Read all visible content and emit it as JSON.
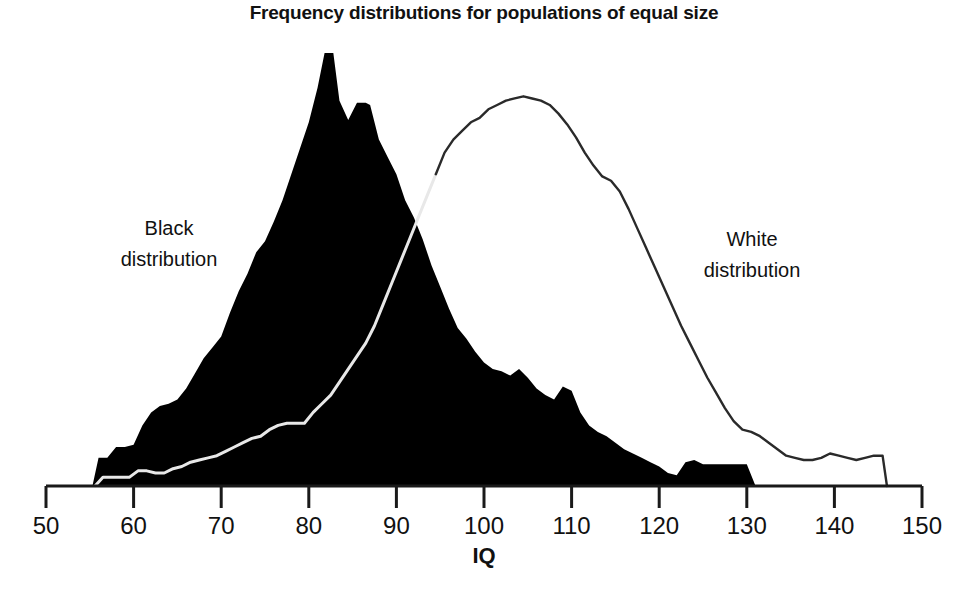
{
  "chart_data": {
    "type": "area",
    "title": "Frequency distributions for populations of equal size",
    "xlabel": "IQ",
    "ylabel": "",
    "xlim": [
      50,
      150
    ],
    "ylim": [
      0,
      100
    ],
    "xticks": [
      50,
      60,
      70,
      80,
      90,
      100,
      110,
      120,
      130,
      140,
      150
    ],
    "xtick_labels": [
      "50",
      "60",
      "70",
      "80",
      "90",
      "100",
      "110",
      "120",
      "130",
      "140",
      "150"
    ],
    "grid": false,
    "legend_position": "inline-annotations",
    "annotations": [
      {
        "text_line1": "Black",
        "text_line2": "distribution",
        "x": 62,
        "y": 62
      },
      {
        "text_line1": "White",
        "text_line2": "distribution",
        "x": 133,
        "y": 57
      }
    ],
    "series": [
      {
        "name": "Black distribution",
        "style": "filled-black-area",
        "color": "#000000",
        "x": [
          55.3,
          56.0,
          57.0,
          58.0,
          59.0,
          60.0,
          61.0,
          62.0,
          63.0,
          64.0,
          65.0,
          66.0,
          67.0,
          68.0,
          69.0,
          70.0,
          71.0,
          72.0,
          73.0,
          74.0,
          75.0,
          76.0,
          77.0,
          78.0,
          79.0,
          80.0,
          81.0,
          81.8,
          82.8,
          83.5,
          84.5,
          85.5,
          86.5,
          87.0,
          88.0,
          89.0,
          90.0,
          91.0,
          92.0,
          93.0,
          94.0,
          95.0,
          96.0,
          97.0,
          98.0,
          99.0,
          100.0,
          101.0,
          102.0,
          103.0,
          104.0,
          105.0,
          106.0,
          107.0,
          108.0,
          109.0,
          110.0,
          111.0,
          112.0,
          113.0,
          114.0,
          115.0,
          116.0,
          117.0,
          118.0,
          119.0,
          120.0,
          121.0,
          122.0,
          123.0,
          124.0,
          125.0,
          126.0,
          127.0,
          128.0,
          129.0,
          130.0,
          131.0
        ],
        "y": [
          0,
          6.5,
          6.5,
          9.0,
          9.0,
          9.5,
          14.0,
          17.0,
          18.5,
          19.0,
          20.0,
          22.5,
          26.0,
          29.5,
          32.0,
          34.5,
          40.0,
          45.0,
          49.0,
          54.0,
          56.5,
          61.0,
          66.0,
          72.0,
          78.0,
          84.0,
          92.0,
          100.0,
          100.0,
          89.0,
          84.5,
          88.5,
          88.5,
          88.0,
          80.0,
          76.0,
          72.0,
          66.0,
          62.0,
          57.0,
          51.0,
          46.0,
          41.0,
          36.5,
          34.0,
          31.0,
          28.5,
          27.0,
          26.5,
          25.5,
          27.0,
          25.0,
          22.5,
          21.0,
          20.0,
          23.0,
          22.0,
          17.0,
          14.0,
          12.5,
          11.5,
          10.0,
          8.5,
          7.5,
          6.5,
          5.5,
          4.5,
          3.0,
          2.5,
          5.5,
          6.0,
          5.0,
          5.0,
          5.0,
          5.0,
          5.0,
          5.0,
          0
        ]
      },
      {
        "name": "White distribution",
        "style": "outline-curve",
        "color": "#2a2a2a",
        "x": [
          55.6,
          56.5,
          57.5,
          58.5,
          59.5,
          60.5,
          61.5,
          62.5,
          63.5,
          64.5,
          65.5,
          66.5,
          67.5,
          68.5,
          69.5,
          70.5,
          71.5,
          72.5,
          73.5,
          74.5,
          75.5,
          76.5,
          77.5,
          78.5,
          79.5,
          80.5,
          81.5,
          82.5,
          83.5,
          84.5,
          85.5,
          86.5,
          87.5,
          88.5,
          89.5,
          90.5,
          91.5,
          92.5,
          93.5,
          94.5,
          95.5,
          96.5,
          97.5,
          98.5,
          99.5,
          100.5,
          101.5,
          102.5,
          103.5,
          104.5,
          105.5,
          106.5,
          107.5,
          108.5,
          109.5,
          110.5,
          111.5,
          112.5,
          113.5,
          114.5,
          115.5,
          116.5,
          117.5,
          118.5,
          119.5,
          120.5,
          121.5,
          122.5,
          123.5,
          124.5,
          125.5,
          126.5,
          127.5,
          128.5,
          129.5,
          130.5,
          131.5,
          132.5,
          133.5,
          134.5,
          135.5,
          136.5,
          137.5,
          138.5,
          139.5,
          140.5,
          141.5,
          142.5,
          143.5,
          144.5,
          145.5,
          146.0
        ],
        "y": [
          0,
          2.0,
          2.0,
          2.0,
          2.0,
          3.5,
          3.5,
          3.0,
          3.0,
          4.0,
          4.5,
          5.5,
          6.0,
          6.5,
          7.0,
          8.0,
          9.0,
          10.0,
          11.0,
          11.5,
          13.0,
          14.0,
          14.5,
          14.5,
          14.5,
          17.0,
          19.0,
          21.0,
          24.0,
          27.0,
          30.0,
          33.0,
          37.0,
          42.0,
          47.0,
          52.0,
          57.0,
          62.0,
          67.0,
          72.0,
          77.0,
          80.0,
          82.0,
          84.0,
          85.0,
          87.0,
          88.0,
          89.0,
          89.5,
          90.0,
          89.5,
          89.0,
          88.0,
          86.0,
          83.5,
          80.5,
          77.0,
          74.0,
          71.5,
          70.5,
          68.0,
          64.0,
          59.5,
          55.0,
          50.5,
          46.0,
          41.5,
          37.0,
          33.0,
          29.0,
          25.0,
          21.5,
          18.0,
          15.0,
          13.0,
          12.5,
          11.5,
          10.0,
          8.5,
          7.0,
          6.5,
          6.0,
          6.0,
          6.5,
          7.5,
          7.0,
          6.5,
          6.0,
          6.5,
          7.0,
          7.0,
          0
        ]
      }
    ]
  },
  "axis": {
    "x_title": "IQ",
    "tick_labels": [
      "50",
      "60",
      "70",
      "80",
      "90",
      "100",
      "110",
      "120",
      "130",
      "140",
      "150"
    ]
  },
  "labels": {
    "black_line1": "Black",
    "black_line2": "distribution",
    "white_line1": "White",
    "white_line2": "distribution"
  },
  "title": "Frequency distributions for populations of equal size",
  "colors": {
    "black_fill": "#000000",
    "white_stroke": "#2a2a2a",
    "inner_line": "#e8e8e8",
    "axis": "#1a1a1a",
    "background": "#ffffff"
  }
}
